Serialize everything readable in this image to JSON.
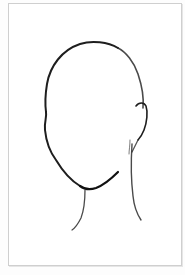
{
  "image": {
    "subject": "Blank face outline sketch",
    "description": "Pencil-style line drawing of a head outline with ear and neck, no facial features, inside a thin gray frame",
    "colors": {
      "background": "#ffffff",
      "frame_border": "#cfcfcf",
      "stroke": "#1e1e1e"
    }
  }
}
